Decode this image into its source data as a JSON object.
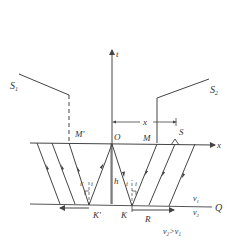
{
  "diagram": {
    "type": "seismic-refraction-raypath",
    "axes": {
      "horizontal_label": "x",
      "vertical_label": "t"
    },
    "curves": {
      "left_travel_time": "S",
      "left_travel_time_sub": "1",
      "right_travel_time": "S",
      "right_travel_time_sub": "2"
    },
    "points": {
      "origin": "O",
      "m": "M",
      "m_prime": "M'",
      "source": "S",
      "k": "K",
      "k_prime": "K'",
      "r": "R"
    },
    "dimensions": {
      "offset": "x",
      "depth": "h"
    },
    "angles": {
      "left_a": "i'",
      "left_b": "i",
      "right_a": "i",
      "right_b": "i"
    },
    "interface": {
      "label": "Q",
      "upper_velocity": "v",
      "upper_velocity_sub": "1",
      "lower_velocity": "v",
      "lower_velocity_sub": "2",
      "condition": "v₂>v₁"
    },
    "colors": {
      "line": "#444444",
      "text": "#333333"
    }
  }
}
